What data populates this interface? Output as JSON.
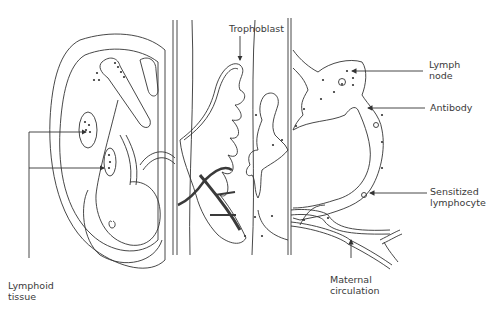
{
  "diagram": {
    "type": "anatomical-illustration",
    "colors": {
      "line": "#333333",
      "dark_vessel": "#3a3a3a",
      "text": "#3a3a3a",
      "background": "#ffffff"
    },
    "labels": {
      "trophoblast": "Trophoblast",
      "lymph_node": "Lymph\nnode",
      "antibody": "Antibody",
      "sensitized_lymphocyte": "Sensitized\nlymphocyte",
      "maternal_circulation": "Maternal\ncirculation",
      "lymphoid_tissue": "Lymphoid\ntissue"
    },
    "regions": [
      "fetus-in-amniotic-sac",
      "placental-villi",
      "maternal-tissue",
      "lymph-node-and-vessels"
    ]
  }
}
